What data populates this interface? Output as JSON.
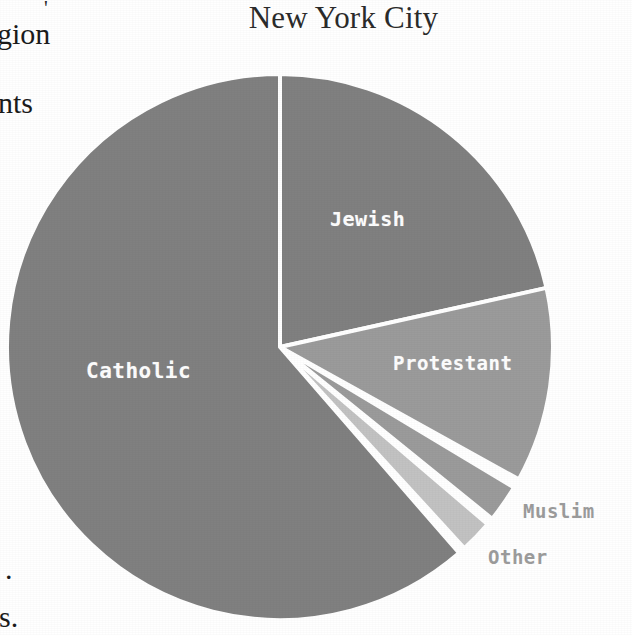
{
  "page": {
    "background_color": "#ffffff",
    "width": 632,
    "height": 635
  },
  "margin_bleed": {
    "description": "cut-off text from the adjacent book column",
    "fragments": [
      {
        "id": "tick",
        "text": "'"
      },
      {
        "id": "gion",
        "text": "gion"
      },
      {
        "id": "nts",
        "text": "nts"
      },
      {
        "id": "period",
        "text": "."
      },
      {
        "id": "s_period",
        "text": "s."
      }
    ]
  },
  "chart_data": {
    "type": "pie",
    "title": "New York City",
    "subtitle": "",
    "xlabel": "",
    "ylabel": "",
    "legend_position": "none",
    "grid": false,
    "start_angle_deg": 0,
    "direction": "clockwise",
    "center": {
      "x": 280,
      "y": 347
    },
    "radius": 273,
    "separator_color": "#ffffff",
    "separator_width": 4,
    "categories": [
      "Jewish",
      "Protestant",
      "Muslim",
      "Other",
      "Catholic"
    ],
    "values": [
      21.5,
      11.5,
      2.2,
      2.0,
      62.8
    ],
    "slices": [
      {
        "label": "Jewish",
        "value": 21.5,
        "color": "#808080",
        "start_deg": 0,
        "end_deg": 77.5,
        "label_placement": "inside",
        "label_color": "#fdfdfd"
      },
      {
        "label": "Protestant",
        "value": 11.5,
        "color": "#9b9b9b",
        "start_deg": 77.5,
        "end_deg": 119.0,
        "label_placement": "inside",
        "label_color": "#fdfdfd"
      },
      {
        "label": "Muslim",
        "value": 2.2,
        "color": "#9b9b9b",
        "start_deg": 121.0,
        "end_deg": 129.0,
        "label_placement": "outside",
        "label_color": "#9c9c9c"
      },
      {
        "label": "Other",
        "value": 2.0,
        "color": "#c2c2c2",
        "start_deg": 130.5,
        "end_deg": 137.5,
        "label_placement": "outside",
        "label_color": "#9c9c9c"
      },
      {
        "label": "Catholic",
        "value": 62.8,
        "color": "#808080",
        "start_deg": 139.0,
        "end_deg": 360.0,
        "label_placement": "inside",
        "label_color": "#fdfdfd"
      }
    ]
  }
}
